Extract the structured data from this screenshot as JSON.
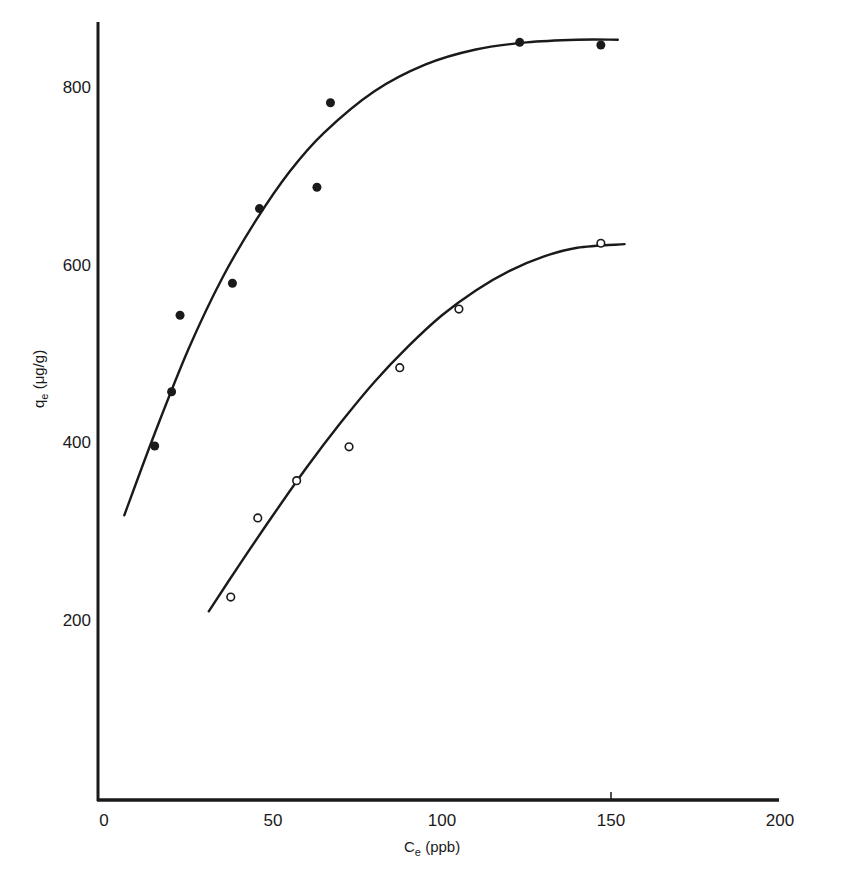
{
  "chart_data": {
    "type": "scatter",
    "title": "",
    "xlabel": "C",
    "xlabel_sub": "e",
    "xlabel_unit": " (ppb)",
    "ylabel": "q",
    "ylabel_sub": "e",
    "ylabel_unit": " (μg/g)",
    "xlim": [
      0,
      200
    ],
    "ylim": [
      0,
      880
    ],
    "xticks": [
      0,
      50,
      100,
      150,
      200
    ],
    "yticks": [
      200,
      400,
      600,
      800
    ],
    "grid": false,
    "legend": "none",
    "series": [
      {
        "name": "filled",
        "marker": "filled-circle",
        "points": [
          {
            "x": 15,
            "y": 396
          },
          {
            "x": 20,
            "y": 457
          },
          {
            "x": 22.5,
            "y": 543
          },
          {
            "x": 38,
            "y": 579
          },
          {
            "x": 46,
            "y": 663
          },
          {
            "x": 63,
            "y": 687
          },
          {
            "x": 67,
            "y": 782
          },
          {
            "x": 123,
            "y": 850
          },
          {
            "x": 147,
            "y": 847
          }
        ],
        "fit_curve": [
          {
            "x": 6,
            "y": 318
          },
          {
            "x": 15,
            "y": 410
          },
          {
            "x": 25,
            "y": 505
          },
          {
            "x": 35,
            "y": 585
          },
          {
            "x": 45,
            "y": 650
          },
          {
            "x": 55,
            "y": 705
          },
          {
            "x": 65,
            "y": 748
          },
          {
            "x": 80,
            "y": 795
          },
          {
            "x": 95,
            "y": 825
          },
          {
            "x": 110,
            "y": 842
          },
          {
            "x": 125,
            "y": 850
          },
          {
            "x": 140,
            "y": 853
          },
          {
            "x": 152,
            "y": 853
          }
        ]
      },
      {
        "name": "open",
        "marker": "open-circle",
        "points": [
          {
            "x": 37.5,
            "y": 226
          },
          {
            "x": 45.5,
            "y": 315
          },
          {
            "x": 57,
            "y": 357
          },
          {
            "x": 72.5,
            "y": 395
          },
          {
            "x": 87.5,
            "y": 484
          },
          {
            "x": 105,
            "y": 550
          },
          {
            "x": 147,
            "y": 624
          }
        ],
        "fit_curve": [
          {
            "x": 31,
            "y": 210
          },
          {
            "x": 40,
            "y": 262
          },
          {
            "x": 50,
            "y": 318
          },
          {
            "x": 60,
            "y": 372
          },
          {
            "x": 70,
            "y": 422
          },
          {
            "x": 80,
            "y": 468
          },
          {
            "x": 90,
            "y": 508
          },
          {
            "x": 100,
            "y": 543
          },
          {
            "x": 110,
            "y": 571
          },
          {
            "x": 120,
            "y": 593
          },
          {
            "x": 130,
            "y": 609
          },
          {
            "x": 140,
            "y": 619
          },
          {
            "x": 154,
            "y": 623
          }
        ]
      }
    ],
    "colors": {
      "ink": "#1a1a1a",
      "background": "#ffffff"
    }
  }
}
